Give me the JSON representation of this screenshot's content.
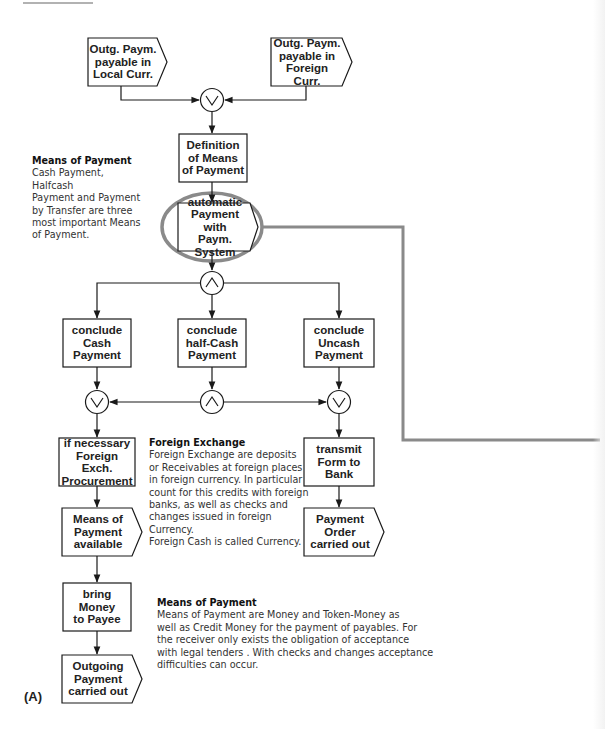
{
  "diagram": {
    "type": "event-driven process chain",
    "label": "(A)",
    "nodes": {
      "event_local": {
        "label": "Outg. Paym.\npayable in\nLocal Curr.",
        "shape": "event"
      },
      "event_foreign": {
        "label": "Outg. Paym.\npayable in\nForeign Curr.",
        "shape": "event"
      },
      "xor_join_top": {
        "symbol": "XOR",
        "glyph": "∨"
      },
      "func_definition": {
        "label": "Definition\nof Means\nof Payment",
        "shape": "function"
      },
      "event_automatic": {
        "label": "automatic\nPayment with\nPaym. System",
        "shape": "event",
        "highlighted": true
      },
      "and_split": {
        "symbol": "AND",
        "glyph": "∧"
      },
      "func_cash": {
        "label": "conclude\nCash\nPayment",
        "shape": "function"
      },
      "func_halfcash": {
        "label": "conclude\nhalf-Cash\nPayment",
        "shape": "function"
      },
      "func_uncash": {
        "label": "conclude\nUncash\nPayment",
        "shape": "function"
      },
      "xor_left": {
        "symbol": "XOR",
        "glyph": "∨"
      },
      "and_middle": {
        "symbol": "AND",
        "glyph": "∧"
      },
      "xor_right": {
        "symbol": "XOR",
        "glyph": "∨"
      },
      "func_procurement": {
        "label": "if necessary\nForeign Exch.\nProcurement",
        "shape": "function"
      },
      "event_means_available": {
        "label": "Means of\nPayment\navailable",
        "shape": "event"
      },
      "func_bring_money": {
        "label": "bring\nMoney\nto Payee",
        "shape": "function"
      },
      "event_outgoing_done": {
        "label": "Outgoing\nPayment\ncarried out",
        "shape": "event"
      },
      "func_transmit": {
        "label": "transmit\nForm to\nBank",
        "shape": "function"
      },
      "event_order_done": {
        "label": "Payment\nOrder\ncarried out",
        "shape": "event"
      }
    },
    "notes": {
      "means_of_payment_1": {
        "title": "Means of Payment",
        "body": "Cash Payment, Halfcash\nPayment and Payment\nby Transfer are three\nmost important Means\nof Payment."
      },
      "foreign_exchange": {
        "title": "Foreign Exchange",
        "body": "Foreign Exchange are deposits\nor Receivables at foreign places\nin foreign currency. In particular\ncount for this credits with foreign\nbanks, as well as checks and\nchanges  issued in foreign Currency.\nForeign Cash is called Currency."
      },
      "means_of_payment_2": {
        "title": "Means of Payment",
        "body": "Means of Payment are Money and Token-Money as\nwell as Credit Money for the payment of payables. For\nthe receiver only exists the obligation of acceptance\nwith legal tenders . With checks and changes acceptance\ndifficulties can occur."
      }
    },
    "colors": {
      "stroke": "#1a1a1a",
      "highlight": "#8a8a8a",
      "text": "#222222"
    }
  }
}
